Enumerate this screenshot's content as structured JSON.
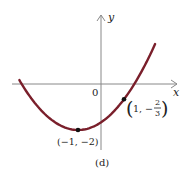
{
  "chart_data": {
    "type": "line",
    "title": "",
    "caption": "(d)",
    "xlabel": "x",
    "ylabel": "y",
    "origin_label": "0",
    "function": "y = (1/3)(x+1)^2 - 2",
    "curve_color": "#7a1f2b",
    "x_range": [
      -3.55,
      2.35
    ],
    "points": [
      {
        "x": -1,
        "y": -2,
        "label": "(−1, −2)"
      },
      {
        "x": 1,
        "y": -0.6667,
        "label_main": "1, −",
        "label_num": "2",
        "label_den": "3"
      }
    ],
    "series": [
      {
        "name": "parabola",
        "x": [
          -3.5,
          -3,
          -2,
          -1,
          0,
          1,
          2,
          2.35
        ],
        "y": [
          0.08,
          -0.67,
          -1.67,
          -2,
          -1.67,
          -0.67,
          1,
          1.74
        ]
      }
    ],
    "grid": false,
    "legend": null
  }
}
